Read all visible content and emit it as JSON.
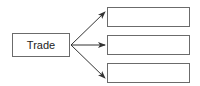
{
  "diagram": {
    "source": {
      "label": "Trade"
    },
    "targets": [
      {
        "label": ""
      },
      {
        "label": ""
      },
      {
        "label": ""
      }
    ],
    "colors": {
      "line": "#333333",
      "border": "#6b6b6b"
    }
  }
}
